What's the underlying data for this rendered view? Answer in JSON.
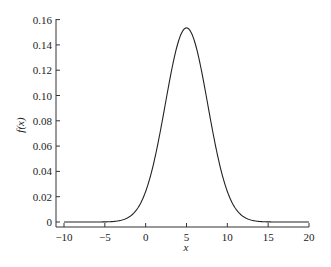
{
  "chart_data": {
    "type": "line",
    "title": "",
    "xlabel": "x",
    "ylabel": "f(x)",
    "xlim": [
      -10,
      20
    ],
    "ylim": [
      0,
      0.16
    ],
    "grid": false,
    "legend": null,
    "x_ticks": [
      -10,
      -5,
      0,
      5,
      10,
      15,
      20
    ],
    "x_tick_labels": [
      "-10",
      "-5",
      "0",
      "5",
      "10",
      "15",
      "20"
    ],
    "y_ticks": [
      0,
      0.02,
      0.04,
      0.06,
      0.08,
      0.1,
      0.12,
      0.14,
      0.16
    ],
    "y_tick_labels": [
      "0",
      "0.02",
      "0.04",
      "0.06",
      "0.08",
      "0.10",
      "0.12",
      "0.14",
      "0.16"
    ],
    "series": [
      {
        "name": "f(x)",
        "description": "Normal density curve, mean approx 5, std approx 2.6, peak approx 0.153",
        "mean": 5,
        "std": 2.6,
        "x": [
          -10,
          -5,
          -2,
          0,
          1,
          2,
          3,
          4,
          5,
          6,
          7,
          8,
          9,
          10,
          12,
          15,
          20
        ],
        "y": [
          0.0,
          0.0,
          0.0041,
          0.0243,
          0.0465,
          0.0788,
          0.1138,
          0.1434,
          0.1534,
          0.1434,
          0.1138,
          0.0788,
          0.0465,
          0.0243,
          0.0041,
          0.0001,
          0.0
        ]
      }
    ]
  }
}
